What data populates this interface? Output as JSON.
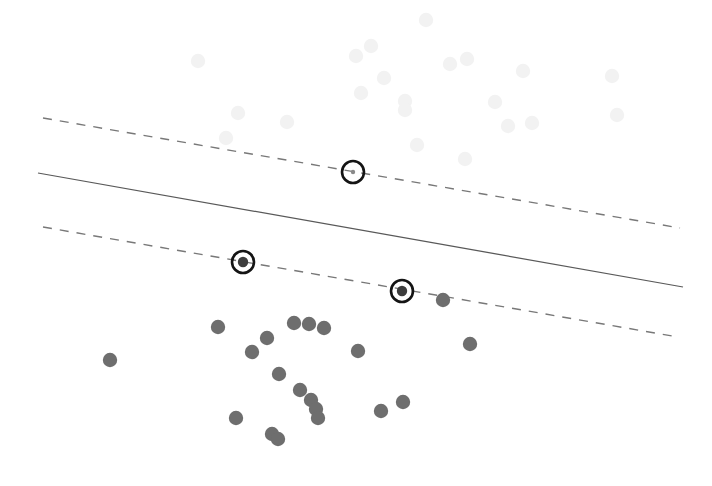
{
  "figure": {
    "title": "",
    "subtitle": "",
    "background_color": "#ffffff",
    "width": 712,
    "height": 486
  },
  "style": {
    "point_color_foreground": "#6e6e6e",
    "point_color_background": "#f2f2f2",
    "fit_line_color": "#595959",
    "band_line_color": "#787878",
    "highlight_ring_color": "#141414",
    "point_radius_foreground": 7.2,
    "point_radius_background": 7.2,
    "highlight_ring_radius": 11,
    "highlight_ring_width": 2.6,
    "fit_line_width": 1.2,
    "band_line_width": 1.4,
    "band_dash_pattern": "9 8"
  },
  "chart_data": {
    "type": "scatter",
    "title": "",
    "xlabel": "",
    "ylabel": "",
    "xlim": [
      0,
      712
    ],
    "ylim": [
      486,
      0
    ],
    "grid": false,
    "axes_visible": false,
    "legend": null,
    "annotations": [],
    "series": [
      {
        "name": "background-points",
        "style": "faint-gray-filled-circle",
        "color": "#f2f2f2",
        "point_count": 21,
        "points": [
          {
            "x": 226,
            "y": 138
          },
          {
            "x": 287,
            "y": 122
          },
          {
            "x": 361,
            "y": 93
          },
          {
            "x": 371,
            "y": 46
          },
          {
            "x": 384,
            "y": 78
          },
          {
            "x": 405,
            "y": 101
          },
          {
            "x": 405,
            "y": 110
          },
          {
            "x": 417,
            "y": 145
          },
          {
            "x": 426,
            "y": 20
          },
          {
            "x": 450,
            "y": 64
          },
          {
            "x": 465,
            "y": 159
          },
          {
            "x": 467,
            "y": 59
          },
          {
            "x": 508,
            "y": 126
          },
          {
            "x": 523,
            "y": 71
          },
          {
            "x": 532,
            "y": 123
          },
          {
            "x": 612,
            "y": 76
          },
          {
            "x": 356,
            "y": 56
          },
          {
            "x": 198,
            "y": 61
          },
          {
            "x": 238,
            "y": 113
          },
          {
            "x": 495,
            "y": 102
          },
          {
            "x": 617,
            "y": 115
          }
        ]
      },
      {
        "name": "foreground-points",
        "style": "gray-filled-circle",
        "color": "#6e6e6e",
        "point_count": 20,
        "points": [
          {
            "x": 110,
            "y": 360
          },
          {
            "x": 218,
            "y": 327
          },
          {
            "x": 236,
            "y": 418
          },
          {
            "x": 252,
            "y": 352
          },
          {
            "x": 267,
            "y": 338
          },
          {
            "x": 272,
            "y": 434
          },
          {
            "x": 278,
            "y": 439
          },
          {
            "x": 279,
            "y": 374
          },
          {
            "x": 294,
            "y": 323
          },
          {
            "x": 309,
            "y": 324
          },
          {
            "x": 311,
            "y": 400
          },
          {
            "x": 316,
            "y": 409
          },
          {
            "x": 318,
            "y": 418
          },
          {
            "x": 324,
            "y": 328
          },
          {
            "x": 358,
            "y": 351
          },
          {
            "x": 381,
            "y": 411
          },
          {
            "x": 403,
            "y": 402
          },
          {
            "x": 470,
            "y": 344
          },
          {
            "x": 443,
            "y": 300
          },
          {
            "x": 300,
            "y": 390
          }
        ]
      },
      {
        "name": "highlighted-points",
        "style": "ringed-marker",
        "color": "#141414",
        "point_count": 3,
        "points": [
          {
            "x": 353,
            "y": 172,
            "filled": false
          },
          {
            "x": 243,
            "y": 262,
            "filled": true
          },
          {
            "x": 402,
            "y": 291,
            "filled": true
          }
        ]
      }
    ],
    "lines": [
      {
        "name": "regression-fit-line",
        "style": "solid",
        "color": "#595959",
        "x1": 38,
        "y1": 173,
        "x2": 683,
        "y2": 287
      },
      {
        "name": "upper-confidence-band",
        "style": "dashed",
        "color": "#787878",
        "x1": 43,
        "y1": 118,
        "x2": 680,
        "y2": 228
      },
      {
        "name": "lower-confidence-band",
        "style": "dashed",
        "color": "#787878",
        "x1": 43,
        "y1": 227,
        "x2": 678,
        "y2": 337
      }
    ]
  }
}
